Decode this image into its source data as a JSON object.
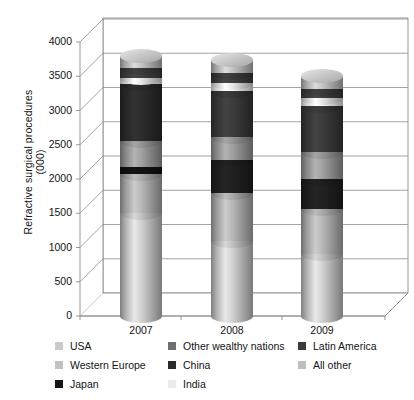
{
  "chart_data": {
    "type": "bar",
    "subtype": "stacked-cylinder-3d",
    "title": "",
    "xlabel": "",
    "ylabel": "Refractive surgical procedures",
    "ylabel_line2": "(000)",
    "categories": [
      "2007",
      "2008",
      "2009"
    ],
    "ylim": [
      0,
      4000
    ],
    "ytick_step": 500,
    "yticks": [
      "0",
      "500",
      "1000",
      "1500",
      "2000",
      "2500",
      "3000",
      "3500",
      "4000"
    ],
    "grid": true,
    "legend_position": "bottom",
    "series": [
      {
        "name": "USA",
        "color": "#c9c9c9",
        "values": [
          1500,
          1100,
          900
        ]
      },
      {
        "name": "Western Europe",
        "color": "#b4b4b4",
        "values": [
          600,
          750,
          700
        ]
      },
      {
        "name": "Japan",
        "color": "#111111",
        "values": [
          100,
          0,
          0
        ]
      },
      {
        "name": "Other wealthy nations",
        "color": "#9a9a9a",
        "values": [
          350,
          0,
          0
        ]
      },
      {
        "name": "China",
        "color": "#2e2e2e",
        "values": [
          900,
          450,
          450
        ]
      },
      {
        "name": "India",
        "color": "#ededed",
        "values": [
          150,
          200,
          250
        ]
      },
      {
        "name": "Latin America",
        "color": "#3f3f3f",
        "values": [
          150,
          300,
          350
        ]
      },
      {
        "name": "All other",
        "color": "#bfbfbf",
        "values": [
          200,
          150,
          150
        ]
      }
    ],
    "stack_order_2007": [
      {
        "name": "USA",
        "color": "#c9c9c9",
        "from": 0,
        "to": 1500
      },
      {
        "name": "Western Europe",
        "color": "#b0b0b0",
        "from": 1500,
        "to": 2080
      },
      {
        "name": "Japan",
        "color": "#121212",
        "from": 2080,
        "to": 2180
      },
      {
        "name": "Other wealthy nations",
        "color": "#9a9a9a",
        "from": 2180,
        "to": 2560
      },
      {
        "name": "China",
        "color": "#2b2b2b",
        "from": 2560,
        "to": 3380
      },
      {
        "name": "India",
        "color": "#f0f0f0",
        "from": 3380,
        "to": 3480
      },
      {
        "name": "Latin America",
        "color": "#3d3d3d",
        "from": 3480,
        "to": 3620
      },
      {
        "name": "All other",
        "color": "#bdbdbd",
        "from": 3620,
        "to": 3800
      }
    ],
    "stack_order_2008": [
      {
        "name": "USA",
        "color": "#c9c9c9",
        "from": 0,
        "to": 1100
      },
      {
        "name": "Western Europe",
        "color": "#b0b0b0",
        "from": 1100,
        "to": 1800
      },
      {
        "name": "China",
        "color": "#1f1f1f",
        "from": 1800,
        "to": 2280
      },
      {
        "name": "Other wealthy nations",
        "color": "#9a9a9a",
        "from": 2280,
        "to": 2620
      },
      {
        "name": "Latin America",
        "color": "#3a3a3a",
        "from": 2620,
        "to": 3280
      },
      {
        "name": "India",
        "color": "#f0f0f0",
        "from": 3280,
        "to": 3400
      },
      {
        "name": "Japan",
        "color": "#3d3d3d",
        "from": 3400,
        "to": 3540
      },
      {
        "name": "All other",
        "color": "#bdbdbd",
        "from": 3540,
        "to": 3740
      }
    ],
    "stack_order_2009": [
      {
        "name": "USA",
        "color": "#c9c9c9",
        "from": 0,
        "to": 900
      },
      {
        "name": "Western Europe",
        "color": "#b0b0b0",
        "from": 900,
        "to": 1560
      },
      {
        "name": "China",
        "color": "#1f1f1f",
        "from": 1560,
        "to": 2000
      },
      {
        "name": "Other wealthy nations",
        "color": "#9a9a9a",
        "from": 2000,
        "to": 2400
      },
      {
        "name": "Latin America",
        "color": "#3a3a3a",
        "from": 2400,
        "to": 3070
      },
      {
        "name": "India",
        "color": "#f0f0f0",
        "from": 3070,
        "to": 3180
      },
      {
        "name": "Japan",
        "color": "#3d3d3d",
        "from": 3180,
        "to": 3320
      },
      {
        "name": "All other",
        "color": "#bdbdbd",
        "from": 3320,
        "to": 3500
      }
    ]
  },
  "axis": {
    "y_title_line1": "Refractive surgical procedures",
    "y_title_line2": "(000)",
    "ticks": [
      "4000",
      "3500",
      "3000",
      "2500",
      "2000",
      "1500",
      "1000",
      "500",
      "0"
    ],
    "categories": [
      "2007",
      "2008",
      "2009"
    ]
  },
  "legend": {
    "columns": [
      [
        {
          "label": "USA",
          "color": "#cacaca"
        },
        {
          "label": "Western Europe",
          "color": "#c2c2c2"
        },
        {
          "label": "Japan",
          "color": "#151515"
        }
      ],
      [
        {
          "label": "Other wealthy nations",
          "color": "#6f6f6f"
        },
        {
          "label": "China",
          "color": "#2a2a2a"
        },
        {
          "label": "India",
          "color": "#ebebeb"
        }
      ],
      [
        {
          "label": "Latin America",
          "color": "#3b3b3b"
        },
        {
          "label": "All other",
          "color": "#bfbfbf"
        }
      ]
    ]
  }
}
